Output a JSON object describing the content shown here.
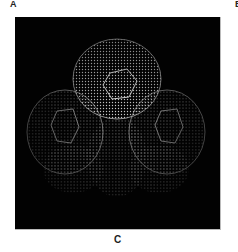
{
  "figure": {
    "panel_labels": {
      "top_left": "A",
      "top_right": "B",
      "caption": "C"
    },
    "image": {
      "description": "3D dot-surface molecular rendering on black background",
      "background_color": "#020202",
      "dot_color": "#d8d8d8"
    }
  }
}
